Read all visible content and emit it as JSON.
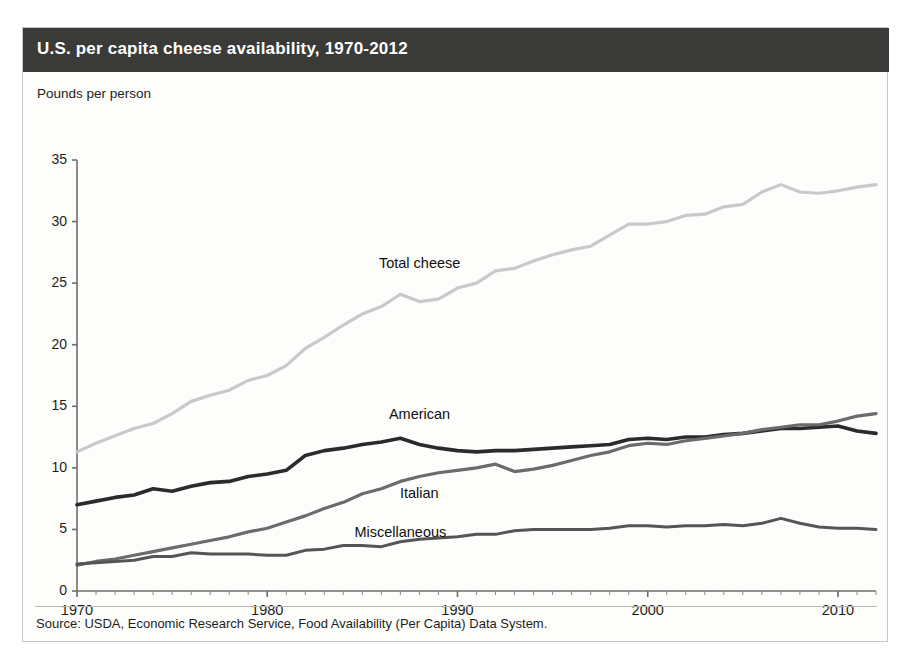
{
  "figure": {
    "title": "U.S. per capita cheese availability, 1970-2012",
    "source": "Source: USDA, Economic Research Service, Food Availability (Per Capita) Data System.",
    "title_bar_color": "#3a3a38",
    "background_color": "#fdfdfb"
  },
  "chart_data": {
    "type": "line",
    "title": "U.S. per capita cheese availability, 1970-2012",
    "xlabel": "",
    "ylabel": "Pounds per person",
    "xlim": [
      1970,
      2012
    ],
    "ylim": [
      0,
      35
    ],
    "ytick_labels": [
      "0",
      "5",
      "10",
      "15",
      "20",
      "25",
      "30",
      "35"
    ],
    "yticks": [
      0,
      5,
      10,
      15,
      20,
      25,
      30,
      35
    ],
    "xtick_labels": [
      "1970",
      "1980",
      "1990",
      "2000",
      "2010"
    ],
    "xticks": [
      1970,
      1980,
      1990,
      2000,
      2010
    ],
    "minor_xtick_interval": 1,
    "grid": false,
    "legend": "inline-labels",
    "x": [
      1970,
      1971,
      1972,
      1973,
      1974,
      1975,
      1976,
      1977,
      1978,
      1979,
      1980,
      1981,
      1982,
      1983,
      1984,
      1985,
      1986,
      1987,
      1988,
      1989,
      1990,
      1991,
      1992,
      1993,
      1994,
      1995,
      1996,
      1997,
      1998,
      1999,
      2000,
      2001,
      2002,
      2003,
      2004,
      2005,
      2006,
      2007,
      2008,
      2009,
      2010,
      2011,
      2012
    ],
    "series": [
      {
        "name": "Total cheese",
        "color": "#c9c9c9",
        "values": [
          11.3,
          12.0,
          12.6,
          13.2,
          13.6,
          14.4,
          15.4,
          15.9,
          16.3,
          17.1,
          17.5,
          18.3,
          19.7,
          20.6,
          21.6,
          22.5,
          23.1,
          24.1,
          23.5,
          23.7,
          24.6,
          25.0,
          26.0,
          26.2,
          26.8,
          27.3,
          27.7,
          28.0,
          28.9,
          29.8,
          29.8,
          30.0,
          30.5,
          30.6,
          31.2,
          31.4,
          32.4,
          33.0,
          32.4,
          32.3,
          32.5,
          32.8,
          33.0
        ]
      },
      {
        "name": "American",
        "color": "#2b2b2b",
        "values": [
          7.0,
          7.3,
          7.6,
          7.8,
          8.3,
          8.1,
          8.5,
          8.8,
          8.9,
          9.3,
          9.5,
          9.8,
          11.0,
          11.4,
          11.6,
          11.9,
          12.1,
          12.4,
          11.9,
          11.6,
          11.4,
          11.3,
          11.4,
          11.4,
          11.5,
          11.6,
          11.7,
          11.8,
          11.9,
          12.3,
          12.4,
          12.3,
          12.5,
          12.5,
          12.7,
          12.8,
          13.0,
          13.2,
          13.2,
          13.3,
          13.4,
          13.0,
          12.8
        ]
      },
      {
        "name": "Italian",
        "color": "#6b6b6b",
        "values": [
          2.1,
          2.4,
          2.6,
          2.9,
          3.2,
          3.5,
          3.8,
          4.1,
          4.4,
          4.8,
          5.1,
          5.6,
          6.1,
          6.7,
          7.2,
          7.9,
          8.3,
          8.9,
          9.3,
          9.6,
          9.8,
          10.0,
          10.3,
          9.7,
          9.9,
          10.2,
          10.6,
          11.0,
          11.3,
          11.8,
          12.0,
          11.9,
          12.2,
          12.4,
          12.6,
          12.8,
          13.1,
          13.3,
          13.5,
          13.5,
          13.8,
          14.2,
          14.4
        ]
      },
      {
        "name": "Miscellaneous",
        "color": "#555555",
        "values": [
          2.2,
          2.3,
          2.4,
          2.5,
          2.8,
          2.8,
          3.1,
          3.0,
          3.0,
          3.0,
          2.9,
          2.9,
          3.3,
          3.4,
          3.7,
          3.7,
          3.6,
          4.0,
          4.2,
          4.3,
          4.4,
          4.6,
          4.6,
          4.9,
          5.0,
          5.0,
          5.0,
          5.0,
          5.1,
          5.3,
          5.3,
          5.2,
          5.3,
          5.3,
          5.4,
          5.3,
          5.5,
          5.9,
          5.5,
          5.2,
          5.1,
          5.1,
          5.0
        ]
      }
    ],
    "annotations": [
      {
        "text": "Total cheese",
        "x": 1988,
        "y": 26.5
      },
      {
        "text": "American",
        "x": 1988,
        "y": 14.2
      },
      {
        "text": "Italian",
        "x": 1988,
        "y": 7.8
      },
      {
        "text": "Miscellaneous",
        "x": 1987,
        "y": 4.6
      }
    ]
  }
}
